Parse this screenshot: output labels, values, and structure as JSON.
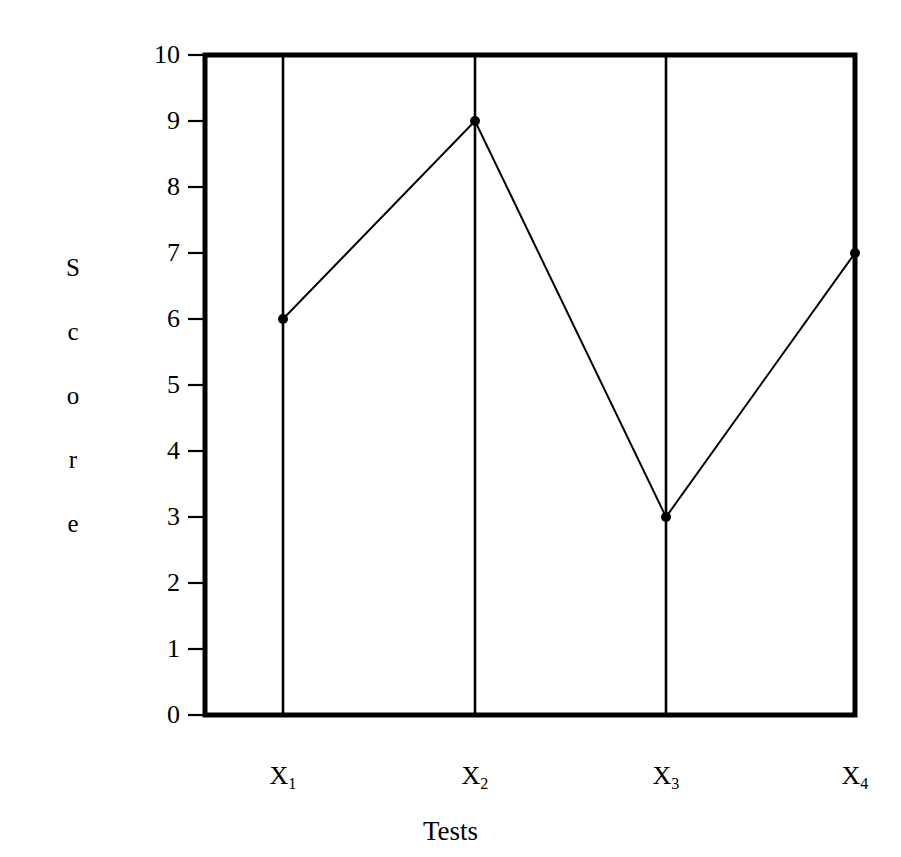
{
  "chart_data": {
    "type": "line",
    "title": "",
    "xlabel": "Tests",
    "ylabel": "Score",
    "ylabel_letters": [
      "S",
      "c",
      "o",
      "r",
      "e"
    ],
    "categories": [
      "X₁",
      "X₂",
      "X₃",
      "X₄"
    ],
    "category_labels": [
      {
        "base": "X",
        "sub": "1"
      },
      {
        "base": "X",
        "sub": "2"
      },
      {
        "base": "X",
        "sub": "3"
      },
      {
        "base": "X",
        "sub": "4"
      }
    ],
    "values": [
      6,
      9,
      3,
      7
    ],
    "series": [
      {
        "name": "Score",
        "values": [
          6,
          9,
          3,
          7
        ]
      }
    ],
    "ylim": [
      0,
      10
    ],
    "yticks": [
      0,
      1,
      2,
      3,
      4,
      5,
      6,
      7,
      8,
      9,
      10
    ],
    "ytick_labels": [
      "0",
      "1",
      "2",
      "3",
      "4",
      "5",
      "6",
      "7",
      "8",
      "9",
      "10"
    ],
    "grid": "vertical-only",
    "legend": "none",
    "marker": "filled-circle",
    "line_color": "#000000",
    "marker_color": "#000000",
    "axis_color": "#000000",
    "background": "#ffffff"
  },
  "plot": {
    "left": 205,
    "right": 855,
    "top": 55,
    "bottom": 715,
    "gridlines_x": [
      283,
      475,
      666,
      855
    ],
    "border_width": 5,
    "gridline_width": 2.6,
    "tick_length": 17,
    "series_line_width": 2.0,
    "marker_radius": 5.0
  }
}
